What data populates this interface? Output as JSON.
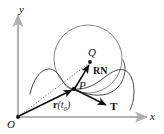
{
  "figure": {
    "background_color": "#ffffff",
    "stroke_color": "#101010",
    "axis_color": "#b4b4b4",
    "curve_color": "#3c3c3c",
    "circle_color": "#6e6e6e",
    "width": 164,
    "height": 134
  },
  "axes": {
    "y_label": "y",
    "x_label": "x",
    "origin_label": "O"
  },
  "points": [
    {
      "id": "Q",
      "label": "Q",
      "x": 90,
      "y": 62,
      "kind": "circle-center"
    },
    {
      "id": "P",
      "label": "P",
      "x": 74,
      "y": 89,
      "kind": "curve-point"
    },
    {
      "id": "O",
      "label": "O",
      "x": 18,
      "y": 117,
      "kind": "origin"
    }
  ],
  "vectors": [
    {
      "id": "position",
      "label": "r",
      "label_arg": "(t",
      "label_sub": "0",
      "label_close": ")",
      "style": "solid",
      "from": "O",
      "to": "P"
    },
    {
      "id": "radius-normal",
      "label": "RN",
      "style": "solid",
      "from": "P",
      "to": "Q"
    },
    {
      "id": "tangent",
      "label": "T",
      "style": "solid",
      "from": "P",
      "to": "tangent-tip"
    },
    {
      "id": "to-center",
      "label": "",
      "style": "dotted",
      "from": "O",
      "to": "Q"
    }
  ],
  "shapes": {
    "osculating_circle": {
      "cx": 88,
      "cy": 59,
      "r": 34
    },
    "curve": {
      "name": "space-curve",
      "description": "looping curve passing through P"
    }
  }
}
